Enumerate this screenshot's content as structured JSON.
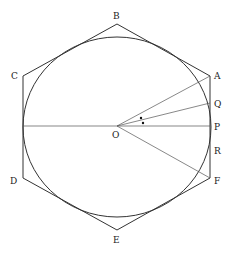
{
  "diagram": {
    "colors": {
      "stroke": "#333333",
      "thin_stroke": "#555555",
      "background": "#ffffff",
      "label": "#222222"
    },
    "center": {
      "id": "O",
      "label": "O",
      "x": 117,
      "y": 126
    },
    "circle": {
      "cx": 117,
      "cy": 127,
      "rx": 94,
      "ry": 90
    },
    "hexagon": {
      "vertices": [
        {
          "id": "A",
          "label": "A",
          "x": 210,
          "y": 76
        },
        {
          "id": "B",
          "label": "B",
          "x": 117,
          "y": 24
        },
        {
          "id": "C",
          "label": "C",
          "x": 23,
          "y": 76
        },
        {
          "id": "D",
          "label": "D",
          "x": 23,
          "y": 178
        },
        {
          "id": "E",
          "label": "E",
          "x": 117,
          "y": 230
        },
        {
          "id": "F",
          "label": "F",
          "x": 210,
          "y": 178
        }
      ]
    },
    "side_points": [
      {
        "id": "Q",
        "label": "Q",
        "x": 210,
        "y": 103
      },
      {
        "id": "P",
        "label": "P",
        "x": 210,
        "y": 126
      },
      {
        "id": "R",
        "label": "R",
        "x": 210,
        "y": 150
      }
    ],
    "labels": {
      "A": "A",
      "B": "B",
      "C": "C",
      "D": "D",
      "E": "E",
      "F": "F",
      "O": "O",
      "P": "P",
      "Q": "Q",
      "R": "R"
    },
    "angle_marks": [
      {
        "x": 141,
        "y": 118
      },
      {
        "x": 143,
        "y": 123
      }
    ]
  }
}
